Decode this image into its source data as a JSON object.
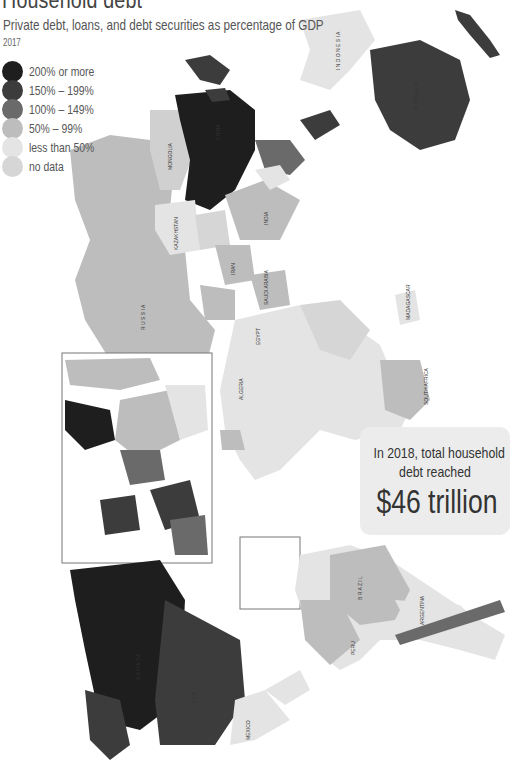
{
  "header": {
    "title": "Household debt",
    "subtitle": "Private debt, loans, and debt securities as percentage of GDP",
    "year": "2017"
  },
  "legend": {
    "items": [
      {
        "label": "200% or more",
        "color": "#1e1e1e"
      },
      {
        "label": "150% – 199%",
        "color": "#3c3c3c"
      },
      {
        "label": "100% – 149%",
        "color": "#6a6a6a"
      },
      {
        "label": "50%  –  99%",
        "color": "#bdbdbd"
      },
      {
        "label": "less than 50%",
        "color": "#e4e4e4"
      },
      {
        "label": "no data",
        "color": "#d6d6d6"
      }
    ]
  },
  "callout": {
    "line1": "In 2018, total household",
    "line2": "debt reached",
    "amount": "$46 trillion"
  },
  "map": {
    "orientation": "rotated 90° (north to the left)",
    "regions": {
      "200_or_more": [
        "China",
        "Canada",
        "Denmark",
        "Netherlands",
        "Switzerland"
      ],
      "150_to_199": [
        "Australia",
        "New Zealand",
        "South Korea",
        "Norway",
        "United Kingdom",
        "Malaysia"
      ],
      "100_to_149": [
        "USA",
        "Thailand",
        "Chile",
        "France",
        "Spain",
        "Sweden",
        "Portugal",
        "Japan"
      ],
      "50_to_99": [
        "Russia",
        "Mongolia",
        "India",
        "Brazil",
        "Saudi Arabia",
        "Iran",
        "Iraq",
        "Peru",
        "Colombia",
        "Poland",
        "Germany"
      ],
      "less_than_50": [
        "Kazakhstan",
        "Mexico",
        "Argentina",
        "Indonesia",
        "Egypt",
        "Algeria",
        "Mali",
        "Niger",
        "Chad",
        "Sudan"
      ]
    },
    "labels": {
      "asia_pacific": [
        "SOLOMON ISLANDS",
        "NEW ZEALAND",
        "PAPUA NEW GUINEA",
        "AUSTRALIA",
        "INDONESIA",
        "TIMOR-LESTE",
        "PHILIPPINES",
        "HONG KONG SAR (CHINA)",
        "VIETNAM",
        "CAMBODIA",
        "MALAYSIA",
        "SINGAPORE",
        "MYANMAR",
        "BANGLADESH",
        "SRI LANKA",
        "MALDIVES",
        "INDIA",
        "CHINA",
        "MONGOLIA",
        "NEPAL"
      ],
      "central_asia_middle_east": [
        "RUSSIA",
        "KAZAKHSTAN",
        "KYRGYZSTAN",
        "TAJIKISTAN",
        "AFGHANISTAN",
        "PAKISTAN",
        "IRAN",
        "IRAQ",
        "KUWAIT",
        "BAHRAIN",
        "SAUDI ARABIA",
        "OMAN",
        "JORDAN",
        "ISRAEL",
        "CYPRUS",
        "TURKEY",
        "GEORGIA",
        "AZER.",
        "YEMEN"
      ],
      "africa": [
        "DJIBOUTI",
        "ERITREA",
        "SUDAN",
        "SOUTH SUDAN",
        "EGYPT",
        "UGANDA",
        "KENYA",
        "TANZANIA",
        "COMOROS",
        "MALAWI",
        "MADAGASCAR",
        "MAURITIUS",
        "ZAMBIA",
        "MOZAMBIQUE",
        "BOTSWANA",
        "SOUTH AFRICA",
        "LESOTHO",
        "RWANDA",
        "BURUNDI",
        "D.R. CONGO",
        "C.A.R.",
        "CHAD",
        "NIGER",
        "NIGERIA",
        "CAMEROON",
        "CONGO",
        "SAO TOME & PRINCIPE",
        "ALGERIA",
        "MALI",
        "BURKINA FASO",
        "BENIN",
        "TOGO",
        "COTE D'IVOIRE",
        "LIBERIA",
        "SIERRA LEONE",
        "GUINEA",
        "GUINEA-BISSAU",
        "GAMBIA",
        "SENEGAL",
        "MAURITANIA",
        "CAPE VERDE",
        "MOROCCO",
        "MALTA"
      ],
      "americas": [
        "BRAZIL",
        "PARAGUAY",
        "URUGUAY",
        "ARGENTINA",
        "CHILE",
        "PERU",
        "ECUADOR",
        "COLOMBIA",
        "VENEZUELA",
        "GUYANA",
        "TRINIDAD & TOBAGO",
        "ST LUCIA",
        "DOMINICA",
        "ST VINCENT & GRENADINES",
        "GRENADA",
        "DOMINICAN REP.",
        "HAITI",
        "BAHAMAS",
        "JAMAICA",
        "HONDURAS",
        "NICARAGUA",
        "COSTA RICA",
        "EL SALVADOR",
        "GUATEMALA",
        "MEXICO",
        "USA",
        "CANADA"
      ]
    }
  }
}
